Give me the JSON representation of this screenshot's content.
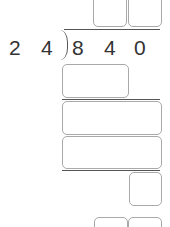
{
  "problem": {
    "divisor": [
      "2",
      "4"
    ],
    "dividend": [
      "8",
      "4",
      "0"
    ]
  },
  "quotient_inputs": [
    {
      "value": ""
    },
    {
      "value": ""
    }
  ],
  "work_inputs": [
    {
      "value": ""
    },
    {
      "value": ""
    },
    {
      "value": ""
    },
    {
      "value": ""
    }
  ],
  "remainder_inputs": [
    {
      "value": ""
    },
    {
      "value": ""
    }
  ]
}
